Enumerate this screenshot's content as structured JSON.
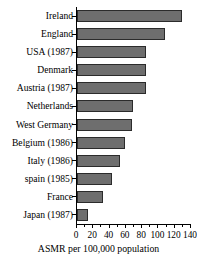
{
  "chart_data": {
    "type": "bar",
    "orientation": "horizontal",
    "title": "",
    "subtitle": "",
    "xlabel": "ASMR per 100,000 population",
    "ylabel": "",
    "xlim": [
      0,
      140
    ],
    "ylim": null,
    "grid": false,
    "legend": null,
    "xticks": [
      0,
      20,
      40,
      60,
      80,
      100,
      120,
      140
    ],
    "xtick_labels": [
      "0",
      "20",
      "40",
      "60",
      "80",
      "100",
      "120",
      "140"
    ],
    "minor_xticks": [
      10,
      30,
      50,
      70,
      90,
      110,
      130
    ],
    "categories": [
      "Ireland",
      "England",
      "USA (1987)",
      "Denmark",
      "Austria (1987)",
      "Netherlands",
      "West Germany",
      "Belgium (1986)",
      "Italy (1986)",
      "spain (1985)",
      "France",
      "Japan (1987)"
    ],
    "values": [
      129,
      108,
      85,
      85,
      85,
      69,
      68,
      59,
      53,
      43,
      32,
      14
    ],
    "bar_color": "#6e6e6e",
    "bar_edge_color": "#2b2b2b",
    "axis_color": "#000000",
    "background_color": "#ffffff"
  }
}
